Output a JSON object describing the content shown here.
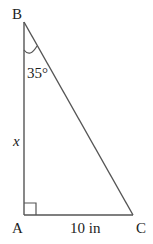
{
  "diagram": {
    "type": "right-triangle",
    "vertices": {
      "B": {
        "label": "B"
      },
      "A": {
        "label": "A"
      },
      "C": {
        "label": "C"
      }
    },
    "angle_B": "35°",
    "side_AB": "x",
    "side_AC": "10 in",
    "right_angle_at": "A",
    "colors": {
      "stroke": "#555555",
      "text": "#222222"
    }
  }
}
